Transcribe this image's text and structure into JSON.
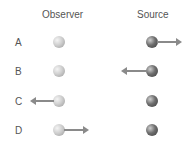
{
  "headers": {
    "observer": "Observer",
    "source": "Source"
  },
  "rows": [
    {
      "label": "A",
      "observer_motion": "none",
      "source_motion": "right"
    },
    {
      "label": "B",
      "observer_motion": "none",
      "source_motion": "left"
    },
    {
      "label": "C",
      "observer_motion": "left",
      "source_motion": "none"
    },
    {
      "label": "D",
      "observer_motion": "right",
      "source_motion": "none"
    }
  ],
  "colors": {
    "observer_ball": "#cfcfcf",
    "source_ball": "#6e6e6e",
    "arrow": "#8a8a8a"
  }
}
